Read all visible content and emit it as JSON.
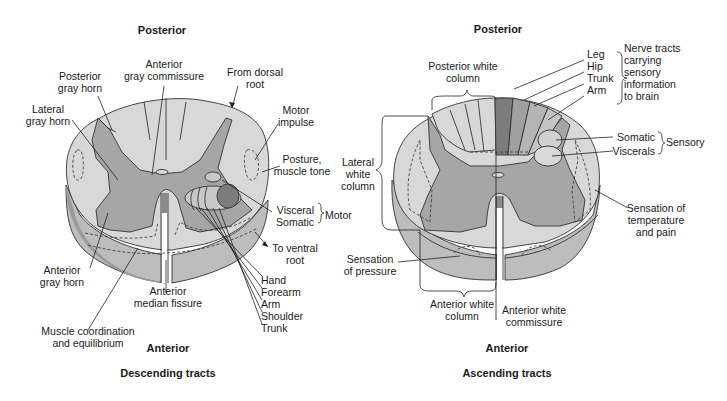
{
  "colors": {
    "white_matter": "#d8d8d8",
    "gray_matter": "#a6a6a6",
    "side_wall": "#bdbdbd",
    "side_wall_dark": "#9a9a9a",
    "dark_tract": "#7c7c7c",
    "mid_tract": "#b4b4b4",
    "outline": "#333333"
  },
  "descending": {
    "top_label": "Posterior",
    "bottom_label": "Anterior",
    "caption": "Descending tracts",
    "labels": {
      "posterior_gray_horn_1": "Posterior",
      "posterior_gray_horn_2": "gray horn",
      "anterior_gray_commissure_1": "Anterior",
      "anterior_gray_commissure_2": "gray commissure",
      "from_dorsal_root_1": "From dorsal",
      "from_dorsal_root_2": "root",
      "lateral_gray_horn_1": "Lateral",
      "lateral_gray_horn_2": "gray horn",
      "motor_impulse_1": "Motor",
      "motor_impulse_2": "impulse",
      "posture_1": "Posture,",
      "posture_2": "muscle tone",
      "visceral": "Visceral",
      "somatic": "Somatic",
      "motor": "Motor",
      "to_ventral_root_1": "To ventral",
      "to_ventral_root_2": "root",
      "anterior_gray_horn_1": "Anterior",
      "anterior_gray_horn_2": "gray horn",
      "anterior_median_fissure_1": "Anterior",
      "anterior_median_fissure_2": "median fissure",
      "muscle_coordination_1": "Muscle coordination",
      "muscle_coordination_2": "and equilibrium"
    },
    "motor_tracts": [
      "Hand",
      "Forearm",
      "Arm",
      "Shoulder",
      "Trunk"
    ]
  },
  "ascending": {
    "top_label": "Posterior",
    "bottom_label": "Anterior",
    "caption": "Ascending tracts",
    "labels": {
      "posterior_white_column_1": "Posterior white",
      "posterior_white_column_2": "column",
      "nerve_tracts_1": "Nerve tracts",
      "nerve_tracts_2": "carrying",
      "nerve_tracts_3": "sensory",
      "nerve_tracts_4": "information",
      "nerve_tracts_5": "to brain",
      "somatic": "Somatic",
      "viscerals": "Viscerals",
      "sensory": "Sensory",
      "lateral_white_column_1": "Lateral",
      "lateral_white_column_2": "white",
      "lateral_white_column_3": "column",
      "sensation_temp_1": "Sensation of",
      "sensation_temp_2": "temperature",
      "sensation_temp_3": "and pain",
      "sensation_pressure_1": "Sensation",
      "sensation_pressure_2": "of pressure",
      "anterior_white_column_1": "Anterior white",
      "anterior_white_column_2": "column",
      "anterior_white_commissure_1": "Anterior white",
      "anterior_white_commissure_2": "commissure"
    },
    "sensory_tracts": [
      "Leg",
      "Hip",
      "Trunk",
      "Arm"
    ]
  }
}
